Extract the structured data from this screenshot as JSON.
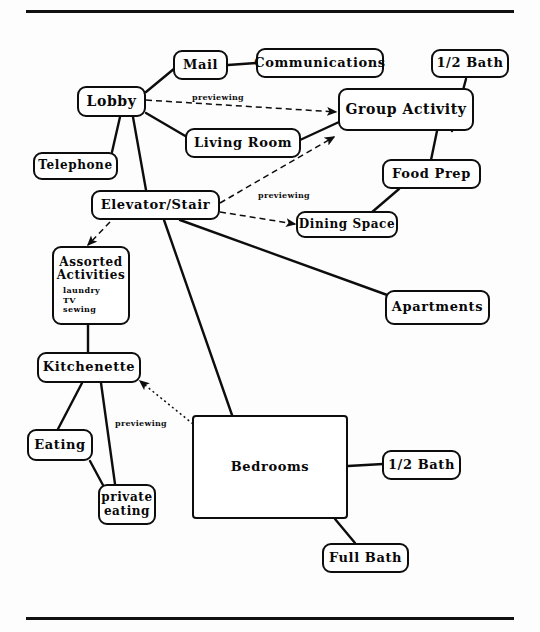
{
  "diagram": {
    "rules": [
      {
        "name": "top-rule",
        "x": 26,
        "y": 10,
        "width": 488
      },
      {
        "name": "bottom-rule",
        "x": 26,
        "y": 617,
        "width": 488
      }
    ],
    "nodes": [
      {
        "id": "mail",
        "label": "Mail",
        "x": 173,
        "y": 50,
        "w": 55,
        "h": 30,
        "font": 13,
        "shape": "rounded"
      },
      {
        "id": "communications",
        "label": "Communications",
        "x": 256,
        "y": 48,
        "w": 128,
        "h": 30,
        "font": 13,
        "shape": "rounded"
      },
      {
        "id": "half_bath_top",
        "label": "1/2 Bath",
        "x": 431,
        "y": 49,
        "w": 78,
        "h": 29,
        "font": 13,
        "shape": "rounded"
      },
      {
        "id": "lobby",
        "label": "Lobby",
        "x": 77,
        "y": 86,
        "w": 69,
        "h": 31,
        "font": 14,
        "shape": "rounded"
      },
      {
        "id": "group_activity",
        "label": "Group Activity",
        "x": 338,
        "y": 88,
        "w": 136,
        "h": 43,
        "font": 14,
        "shape": "rounded"
      },
      {
        "id": "living_room",
        "label": "Living Room",
        "x": 185,
        "y": 128,
        "w": 116,
        "h": 30,
        "font": 13,
        "shape": "rounded"
      },
      {
        "id": "telephone",
        "label": "Telephone",
        "x": 33,
        "y": 152,
        "w": 85,
        "h": 28,
        "font": 12,
        "shape": "rounded"
      },
      {
        "id": "food_prep",
        "label": "Food Prep",
        "x": 382,
        "y": 159,
        "w": 99,
        "h": 30,
        "font": 13,
        "shape": "rounded"
      },
      {
        "id": "elevator_stair",
        "label": "Elevator/Stair",
        "x": 91,
        "y": 190,
        "w": 129,
        "h": 30,
        "font": 13,
        "shape": "rounded"
      },
      {
        "id": "dining_space",
        "label": "Dining Space",
        "x": 296,
        "y": 211,
        "w": 102,
        "h": 27,
        "font": 12,
        "shape": "rounded"
      },
      {
        "id": "assorted",
        "label": "Assorted\nActivities",
        "x": 52,
        "y": 246,
        "w": 78,
        "h": 79,
        "font": 12,
        "shape": "rounded",
        "sub_items": [
          "laundry",
          "TV",
          "sewing"
        ]
      },
      {
        "id": "apartments",
        "label": "Apartments",
        "x": 385,
        "y": 290,
        "w": 105,
        "h": 35,
        "font": 13,
        "shape": "rounded"
      },
      {
        "id": "kitchenette",
        "label": "Kitchenette",
        "x": 37,
        "y": 352,
        "w": 104,
        "h": 31,
        "font": 13,
        "shape": "rounded"
      },
      {
        "id": "bedrooms",
        "label": "Bedrooms",
        "x": 192,
        "y": 415,
        "w": 156,
        "h": 104,
        "font": 13,
        "shape": "square"
      },
      {
        "id": "eating",
        "label": "Eating",
        "x": 27,
        "y": 429,
        "w": 66,
        "h": 32,
        "font": 13,
        "shape": "rounded"
      },
      {
        "id": "half_bath_bed",
        "label": "1/2 Bath",
        "x": 382,
        "y": 450,
        "w": 79,
        "h": 30,
        "font": 13,
        "shape": "rounded"
      },
      {
        "id": "private_eating",
        "label": "private\neating",
        "x": 98,
        "y": 484,
        "w": 58,
        "h": 41,
        "font": 12,
        "shape": "rounded"
      },
      {
        "id": "full_bath",
        "label": "Full Bath",
        "x": 322,
        "y": 543,
        "w": 87,
        "h": 30,
        "font": 13,
        "shape": "rounded"
      }
    ],
    "edge_labels": [
      {
        "id": "prev_lobby_group",
        "text": "previewing",
        "x": 192,
        "y": 92
      },
      {
        "id": "prev_elev_dining",
        "text": "previewing",
        "x": 258,
        "y": 190
      },
      {
        "id": "prev_bed_kitchen",
        "text": "previewing",
        "x": 115,
        "y": 418
      }
    ],
    "edges": [
      {
        "from": "lobby",
        "to": "mail",
        "type": "solid"
      },
      {
        "from": "mail",
        "to": "communications",
        "type": "solid"
      },
      {
        "from": "lobby",
        "to": "living_room",
        "type": "solid"
      },
      {
        "from": "lobby",
        "to": "telephone",
        "type": "solid"
      },
      {
        "from": "lobby",
        "to": "elevator_stair",
        "type": "solid"
      },
      {
        "from": "lobby",
        "to": "group_activity",
        "type": "dashed-arrow",
        "label": "previewing"
      },
      {
        "from": "living_room",
        "to": "group_activity",
        "type": "solid"
      },
      {
        "from": "group_activity",
        "to": "half_bath_top",
        "type": "solid"
      },
      {
        "from": "group_activity",
        "to": "food_prep",
        "type": "solid"
      },
      {
        "from": "food_prep",
        "to": "dining_space",
        "type": "solid"
      },
      {
        "from": "elevator_stair",
        "to": "group_activity",
        "type": "dashed-arrow"
      },
      {
        "from": "elevator_stair",
        "to": "dining_space",
        "type": "dashed-arrow",
        "label": "previewing"
      },
      {
        "from": "elevator_stair",
        "to": "assorted",
        "type": "dashed-arrow"
      },
      {
        "from": "elevator_stair",
        "to": "apartments",
        "type": "solid"
      },
      {
        "from": "elevator_stair",
        "to": "bedrooms",
        "type": "solid"
      },
      {
        "from": "assorted",
        "to": "kitchenette",
        "type": "solid"
      },
      {
        "from": "kitchenette",
        "to": "eating",
        "type": "solid"
      },
      {
        "from": "kitchenette",
        "to": "private_eating",
        "type": "solid"
      },
      {
        "from": "eating",
        "to": "private_eating",
        "type": "solid"
      },
      {
        "from": "bedrooms",
        "to": "kitchenette",
        "type": "dotted-arrow",
        "label": "previewing"
      },
      {
        "from": "bedrooms",
        "to": "half_bath_bed",
        "type": "solid"
      },
      {
        "from": "bedrooms",
        "to": "full_bath",
        "type": "solid"
      }
    ],
    "line_geometry": {
      "solid_paths": [
        "M 146 92 L 175 68",
        "M 228 65 L 256 63",
        "M 120 117 L 112 152",
        "M 133 117 L 146 190",
        "M 146 113 L 187 137",
        "M 300 140 L 339 122",
        "M 452 131 L 466 79",
        "M 437 131 L 431 160",
        "M 399 189 L 371 213",
        "M 180 220 L 390 296",
        "M 164 220 L 232 415",
        "M 88 325 L 88 352",
        "M 82 383 L 58 429",
        "M 101 383 L 115 484",
        "M 90 461 L 104 487",
        "M 348 466 L 383 464",
        "M 335 519 L 355 543"
      ],
      "dashed_paths": [
        "M 146 100 L 336 112",
        "M 220 203 L 334 137",
        "M 220 212 L 295 224",
        "M 110 222 L 88 245"
      ],
      "dotted_paths": [
        "M 193 424 L 140 381"
      ]
    },
    "style": {
      "stroke": "#0d0d0d",
      "background": "#fdfdfd",
      "text": "#080808"
    }
  }
}
